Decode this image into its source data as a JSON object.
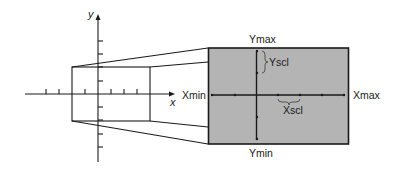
{
  "diagram": {
    "coordinate_plane": {
      "x_axis_label": "x",
      "y_axis_label": "y"
    },
    "screen": {
      "fill_color": "#b4b4b4",
      "border_color": "#1a1a1a",
      "labels": {
        "ymax": "Ymax",
        "ymin": "Ymin",
        "xmin": "Xmin",
        "xmax": "Xmax",
        "yscl": "Yscl",
        "xscl": "Xscl"
      }
    }
  }
}
